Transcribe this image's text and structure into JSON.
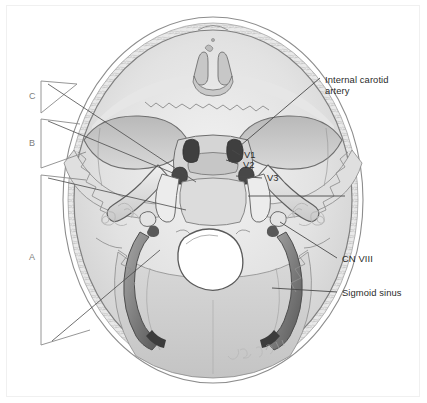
{
  "figure": {
    "artist_signature": "J. Gregory '13",
    "view": "superior view of skull base"
  },
  "labels": {
    "internal_carotid_artery": "Internal carotid\nartery",
    "internal_carotid_artery_line1": "Internal carotid",
    "internal_carotid_artery_line2": "artery",
    "v1": "V1",
    "v2": "V2",
    "v3": "V3",
    "cn_viii": "CN VIII",
    "sigmoid_sinus": "Sigmoid sinus"
  },
  "brackets": [
    {
      "id": "C",
      "label": "C"
    },
    {
      "id": "B",
      "label": "B"
    },
    {
      "id": "A",
      "label": "A"
    }
  ],
  "colors": {
    "bone_light": "#dcdcdc",
    "bone_mid": "#c2c2c2",
    "bone_dark": "#9a9a9a",
    "canal_dark": "#4a4a4a",
    "sinus": "#8e8e8e",
    "leader": "#4a4a4a",
    "bracket": "#8a8a8a",
    "text": "#2b2b2b",
    "background": "#ffffff"
  }
}
